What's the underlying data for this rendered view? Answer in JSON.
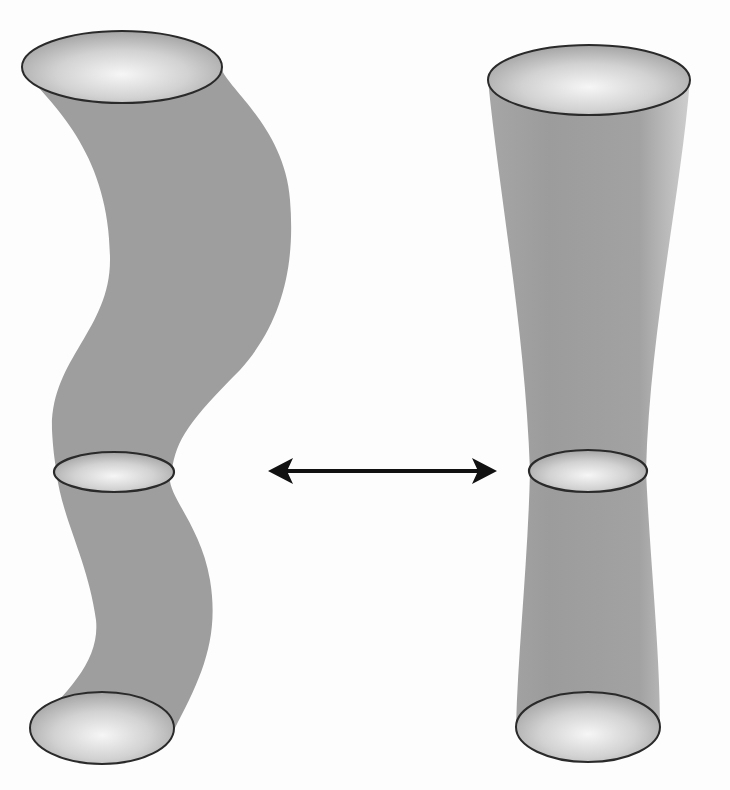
{
  "figure": {
    "colors": {
      "background": "#fdfdfd",
      "tube_fill": "#9e9e9e",
      "rim_stroke": "#2a2a2a",
      "rim_highlight": "#f4f4f4",
      "rim_shadow": "#a8a8a8",
      "arrow": "#111111"
    },
    "left_tube": {
      "name": "wavy-tube",
      "shape": "S-curved tube",
      "ellipses": [
        {
          "position": "top",
          "cx": 122,
          "cy": 67,
          "rx": 100,
          "ry": 36
        },
        {
          "position": "middle",
          "cx": 114,
          "cy": 472,
          "rx": 60,
          "ry": 20
        },
        {
          "position": "bottom",
          "cx": 102,
          "cy": 728,
          "rx": 72,
          "ry": 36
        }
      ]
    },
    "right_tube": {
      "name": "hourglass-tube",
      "shape": "neck-tapered tube",
      "ellipses": [
        {
          "position": "top",
          "cx": 589,
          "cy": 80,
          "rx": 101,
          "ry": 35
        },
        {
          "position": "middle",
          "cx": 588,
          "cy": 471,
          "rx": 59,
          "ry": 21
        },
        {
          "position": "bottom",
          "cx": 588,
          "cy": 727,
          "rx": 72,
          "ry": 35
        }
      ]
    },
    "arrow": {
      "type": "double-headed",
      "x1": 268,
      "x2": 497,
      "y": 471
    }
  }
}
